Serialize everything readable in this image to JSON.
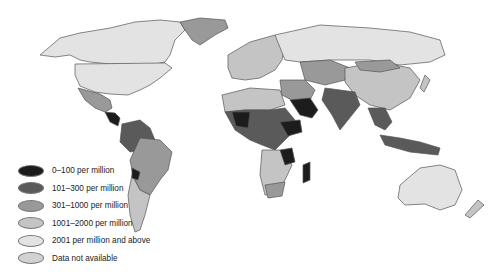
{
  "map": {
    "type": "choropleth world map",
    "subject": "per million population (categorical bands)"
  },
  "colors": {
    "band_0_100": "#1c1c1c",
    "band_101_300": "#5a5a5a",
    "band_301_1000": "#999999",
    "band_1001_2000": "#c4c4c4",
    "band_2001_plus": "#e3e3e3",
    "no_data": "#d2d2d2",
    "border": "#555555"
  },
  "legend": {
    "items": [
      {
        "label": "0–100 per million",
        "color": "#1c1c1c"
      },
      {
        "label": "101–300 per million",
        "color": "#5a5a5a"
      },
      {
        "label": "301–1000 per million",
        "color": "#999999"
      },
      {
        "label": "1001–2000 per million",
        "color": "#c4c4c4"
      },
      {
        "label": "2001 per million and above",
        "color": "#e3e3e3"
      },
      {
        "label": "Data not available",
        "color": "#d2d2d2"
      }
    ]
  }
}
